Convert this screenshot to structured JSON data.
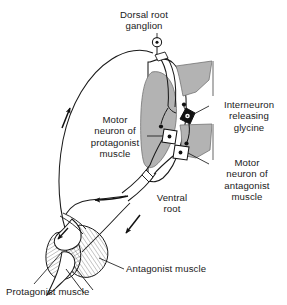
{
  "figure": {
    "type": "anatomical-diagram",
    "width": 287,
    "height": 305,
    "background_color": "#ffffff",
    "ink_color": "#1a1a1a",
    "gray_matter_color": "#b3b3b3",
    "interneuron_fill": "#111111",
    "motor_neuron_fill": "#ffffff"
  },
  "labels": {
    "dorsal_root_ganglion": "Dorsal root\nganglion",
    "interneuron_releasing_glycine": "Interneuron\nreleasing\nglycine",
    "motor_neuron_protagonist": "Motor\nneuron of\nprotagonist\nmuscle",
    "motor_neuron_antagonist": "Motor\nneuron of\nantagonist\nmuscle",
    "ventral_root": "Ventral\nroot",
    "antagonist_muscle": "Antagonist muscle",
    "protagonist_muscle": "Protagonist muscle"
  },
  "structures": {
    "spinal_cord": "spinal-cord-cross-section",
    "gray_matter": "butterfly-shaped-gray-matter",
    "dorsal_horn": "dorsal-horn",
    "ventral_horn": "ventral-horn",
    "ganglion_marker": "dorsal-root-ganglion-cell",
    "interneuron_soma": "glycinergic-interneuron-soma",
    "motor_neuron_soma_protagonist": "alpha-motor-neuron-soma-protagonist",
    "motor_neuron_soma_antagonist": "alpha-motor-neuron-soma-antagonist",
    "sensory_afferent_fiber": "muscle-spindle-afferent",
    "ventral_root_sheath": "ventral-root-sheath",
    "limb_joint": "limb-joint-with-muscles",
    "protagonist_muscle_belly": "protagonist-muscle-striations",
    "antagonist_muscle_belly": "antagonist-muscle-striations"
  },
  "flow_arrows": [
    {
      "name": "afferent-arrow-upward",
      "direction": "up",
      "pathway": "sensory-afferent-to-cord"
    },
    {
      "name": "efferent-arrow-leftward",
      "direction": "left",
      "pathway": "motor-efferent-to-protagonist"
    },
    {
      "name": "efferent-arrow-downleft",
      "direction": "down-left",
      "pathway": "motor-efferent-to-antagonist"
    }
  ]
}
